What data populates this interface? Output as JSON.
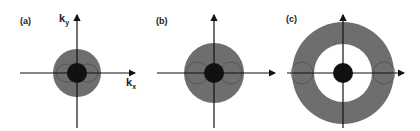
{
  "panels": [
    {
      "label": "(a)",
      "x_axis": "k",
      "x_sub": "x",
      "y_axis": "k",
      "y_sub": "y"
    },
    {
      "label": "(b)"
    },
    {
      "label": "(c)"
    }
  ],
  "colors": {
    "outer_disk": "#6e6e6e",
    "inner_disk": "#111111",
    "axes": "#111111",
    "background": "#ffffff"
  }
}
